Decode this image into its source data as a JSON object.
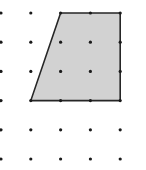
{
  "diagram": {
    "type": "dot-grid-polygon",
    "grid": {
      "columns": 5,
      "rows": 6,
      "origin_x": 1,
      "origin_y": 13,
      "spacing_x": 29.8,
      "spacing_y": 29.2,
      "dot_radius": 1.6,
      "dot_color": "#1a1a1a"
    },
    "shape": {
      "name": "trapezoid",
      "vertices_grid": [
        [
          2,
          0
        ],
        [
          4,
          0
        ],
        [
          4,
          3
        ],
        [
          1,
          3
        ]
      ],
      "fill_color": "#d2d2d2",
      "stroke_color": "#262626",
      "stroke_width": 1.6
    },
    "background_color": "#ffffff"
  }
}
